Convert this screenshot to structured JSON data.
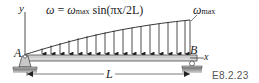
{
  "figure": {
    "id_label": "E8.2.23",
    "load_equation": {
      "lhs": "ω",
      "equals": "=",
      "rhs_symbol": "ω",
      "rhs_subscript": "max",
      "rhs_function": "sin(πx/2L)"
    },
    "max_load_label": {
      "symbol": "ω",
      "subscript": "max"
    },
    "point_labels": {
      "left_support": "A",
      "right_support": "B"
    },
    "axis_labels": {
      "x": "x",
      "y": "y"
    },
    "dimension_label": "L",
    "supports": {
      "A": "pin",
      "B": "roller"
    },
    "load_distribution": "sinusoidal, zero at A, maximum at B",
    "colors": {
      "ink": "#222222",
      "beam_fill": "#d9d9d9",
      "support_fill": "#c8c8c8",
      "ground_fill": "#9a9a9a",
      "figure_id": "#555555"
    }
  }
}
